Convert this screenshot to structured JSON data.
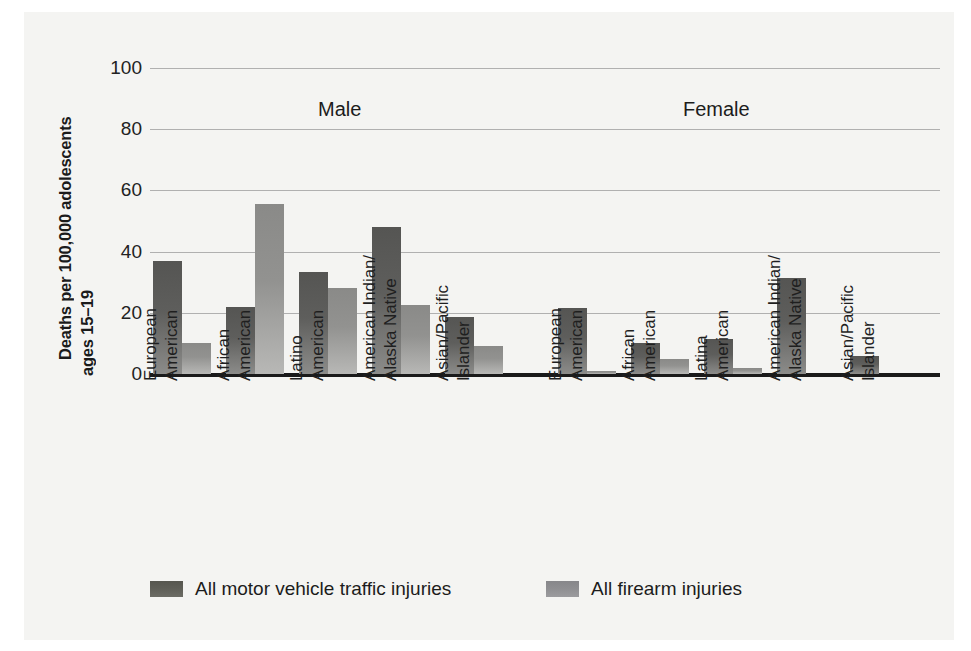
{
  "chart_data": {
    "type": "bar",
    "title": "",
    "xlabel": "",
    "ylabel_line1": "Deaths per 100,000 adolescents",
    "ylabel_line2": "ages 15–19",
    "ylim": [
      0,
      100
    ],
    "yticks": [
      100,
      80,
      60,
      40,
      20,
      0
    ],
    "grid": true,
    "legend_position": "bottom",
    "panels": [
      {
        "name": "Male",
        "categories": [
          {
            "line1": "European",
            "line2": "American"
          },
          {
            "line1": "African",
            "line2": "American"
          },
          {
            "line1": "Latino",
            "line2": "American"
          },
          {
            "line1": "American Indian/",
            "line2": "Alaska Native"
          },
          {
            "line1": "Asian/Pacific",
            "line2": "Islander"
          }
        ],
        "series": [
          {
            "name": "All motor vehicle traffic injuries",
            "values": [
              37,
              22,
              33.5,
              48,
              18.5
            ]
          },
          {
            "name": "All firearm  injuries",
            "values": [
              10,
              55.5,
              28,
              22.5,
              9
            ]
          }
        ]
      },
      {
        "name": "Female",
        "categories": [
          {
            "line1": "European",
            "line2": "American"
          },
          {
            "line1": "African",
            "line2": "American"
          },
          {
            "line1": "Latina",
            "line2": "American"
          },
          {
            "line1": "American Indian/",
            "line2": "Alaska Native"
          },
          {
            "line1": "Asian/Pacific",
            "line2": "Islander"
          }
        ],
        "series": [
          {
            "name": "All motor vehicle traffic injuries",
            "values": [
              21.5,
              10,
              11.5,
              31.5,
              6
            ]
          },
          {
            "name": "All firearm  injuries",
            "values": [
              1,
              5,
              2,
              0,
              0
            ]
          }
        ]
      }
    ],
    "legend": [
      {
        "key": "mv",
        "label": "All motor vehicle traffic injuries",
        "color": "#5c5c58"
      },
      {
        "key": "fa",
        "label": "All firearm  injuries",
        "color": "#919194"
      }
    ],
    "colors": {
      "motor_vehicle": "#5c5c58",
      "firearm": "#919194",
      "gridline": "#b0b0b0",
      "axis": "#1a1a1a",
      "background": "#f4f4f2",
      "text": "#1c1c1c"
    }
  },
  "panel_titles": {
    "male": "Male",
    "female": "Female"
  }
}
